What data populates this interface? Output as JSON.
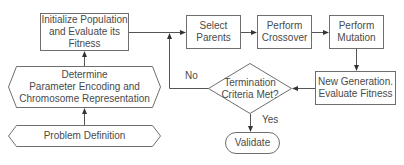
{
  "diagram": {
    "colors": {
      "stroke": "#6e6e6e",
      "text": "#4a4a4a",
      "background": "#ffffff"
    },
    "nodes": {
      "init": {
        "shape": "rectangle",
        "label": "Initialize Population\nand Evaluate its\nFitness"
      },
      "encoding": {
        "shape": "hexagon",
        "label": "Determine\nParameter Encoding and\nChromosome Representation"
      },
      "problem": {
        "shape": "hexagon",
        "label": "Problem Definition"
      },
      "select": {
        "shape": "rectangle",
        "label": "Select\nParents"
      },
      "crossover": {
        "shape": "rectangle",
        "label": "Perform\nCrossover"
      },
      "mutation": {
        "shape": "rectangle",
        "label": "Perform\nMutation"
      },
      "newgen": {
        "shape": "rectangle",
        "label": "New Generation.\nEvaluate Fitness"
      },
      "termination": {
        "shape": "diamond",
        "label": "Termination\nCriteria Met?"
      },
      "validate": {
        "shape": "rounded",
        "label": "Validate"
      }
    },
    "edges": [
      {
        "from": "problem",
        "to": "encoding",
        "label": ""
      },
      {
        "from": "encoding",
        "to": "init",
        "label": ""
      },
      {
        "from": "init",
        "to": "select",
        "label": ""
      },
      {
        "from": "select",
        "to": "crossover",
        "label": ""
      },
      {
        "from": "crossover",
        "to": "mutation",
        "label": ""
      },
      {
        "from": "mutation",
        "to": "newgen",
        "label": ""
      },
      {
        "from": "newgen",
        "to": "termination",
        "label": ""
      },
      {
        "from": "termination",
        "to": "select",
        "label": "No"
      },
      {
        "from": "termination",
        "to": "validate",
        "label": "Yes"
      }
    ],
    "edge_labels": {
      "no": "No",
      "yes": "Yes"
    }
  }
}
